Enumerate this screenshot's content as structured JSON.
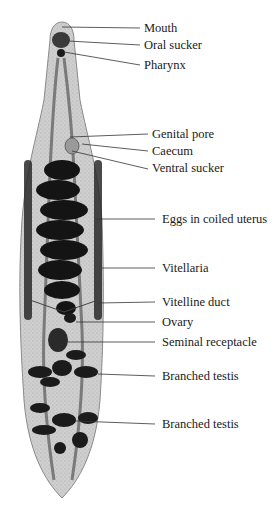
{
  "figure": {
    "colors": {
      "background": "#ffffff",
      "body_fill": "#cfcfcf",
      "body_outline": "#8a8a8a",
      "organs_dark": "#1b1b1b",
      "leader_line": "#333333",
      "text": "#1a1a1a"
    }
  },
  "labels": [
    {
      "id": "mouth",
      "text": "Mouth",
      "x": 144,
      "y": 21,
      "line": [
        62,
        27,
        140,
        28
      ]
    },
    {
      "id": "oral-sucker",
      "text": "Oral sucker",
      "x": 144,
      "y": 38,
      "line": [
        68,
        41,
        140,
        45
      ]
    },
    {
      "id": "pharynx",
      "text": "Pharynx",
      "x": 144,
      "y": 58,
      "line": [
        64,
        52,
        140,
        65
      ]
    },
    {
      "id": "genital-pore",
      "text": "Genital pore",
      "x": 152,
      "y": 127,
      "line": [
        70,
        137,
        148,
        134
      ]
    },
    {
      "id": "caecum",
      "text": "Caecum",
      "x": 152,
      "y": 144,
      "line": [
        82,
        144,
        148,
        151
      ]
    },
    {
      "id": "ventral-sucker",
      "text": "Ventral sucker",
      "x": 152,
      "y": 161,
      "line": [
        72,
        151,
        148,
        169
      ]
    },
    {
      "id": "eggs-in-coiled-uterus",
      "text": "Eggs in coiled uterus",
      "x": 162,
      "y": 212,
      "line": [
        96,
        219,
        155,
        219
      ]
    },
    {
      "id": "vitellaria",
      "text": "Vitellaria",
      "x": 162,
      "y": 261,
      "line": [
        115,
        268,
        155,
        268
      ]
    },
    {
      "id": "vitelline-duct",
      "text": "Vitelline duct",
      "x": 162,
      "y": 295,
      "line": [
        100,
        304,
        155,
        302
      ]
    },
    {
      "id": "ovary",
      "text": "Ovary",
      "x": 162,
      "y": 315,
      "line": [
        76,
        322,
        155,
        322
      ]
    },
    {
      "id": "seminal-receptacle",
      "text": "Seminal receptacle",
      "x": 162,
      "y": 335,
      "line": [
        70,
        342,
        155,
        342
      ]
    },
    {
      "id": "branched-testis-1",
      "text": "Branched testis",
      "x": 162,
      "y": 369,
      "line": [
        104,
        372,
        155,
        376
      ]
    },
    {
      "id": "branched-testis-2",
      "text": "Branched testis",
      "x": 162,
      "y": 417,
      "line": [
        80,
        420,
        155,
        424
      ]
    }
  ]
}
